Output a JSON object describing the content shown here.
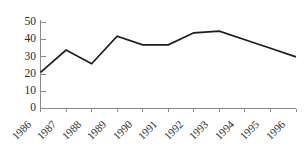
{
  "chart_data": {
    "type": "line",
    "title": "",
    "subtitle": "",
    "xlabel": "",
    "ylabel": "",
    "categories": [
      "1986",
      "1987",
      "1988",
      "1989",
      "1990",
      "1991",
      "1992",
      "1993",
      "1994",
      "1995",
      "1996"
    ],
    "values": [
      21,
      34,
      26,
      42,
      37,
      37,
      44,
      45,
      40,
      35,
      30
    ],
    "series": [
      {
        "name": "",
        "values": [
          21,
          34,
          26,
          42,
          37,
          37,
          44,
          45,
          40,
          35,
          30
        ],
        "color": "#1c1c1c"
      }
    ],
    "ylim": [
      0,
      50
    ],
    "ytick_labels": [
      "0",
      "10",
      "20",
      "30",
      "40",
      "50"
    ],
    "ytick_values": [
      0,
      10,
      20,
      30,
      40,
      50
    ],
    "xtick_labels": [
      "1986",
      "1987",
      "1988",
      "1989",
      "1990",
      "1991",
      "1992",
      "1993",
      "1994",
      "1995",
      "1996"
    ],
    "xtick_rotation": -45,
    "grid": false,
    "legend": false,
    "legend_position": "none",
    "annotations": [],
    "colors": {
      "line": "#1c1c1c",
      "axis": "#8a8a8a",
      "text": "#2b2b2b",
      "background": "#ffffff"
    }
  }
}
